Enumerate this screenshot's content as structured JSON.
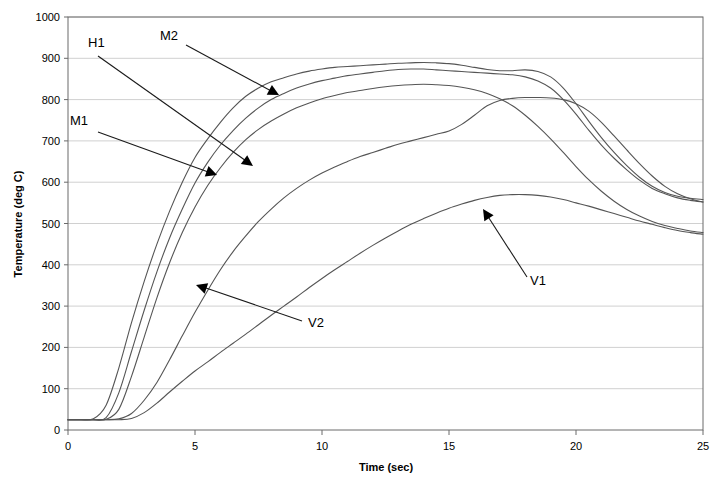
{
  "chart_data": {
    "type": "line",
    "title": "",
    "xlabel": "Time (sec)",
    "ylabel": "Temperature (deg C)",
    "xlim": [
      0,
      25
    ],
    "ylim": [
      0,
      1000
    ],
    "xticks": [
      0,
      5,
      10,
      15,
      20,
      25
    ],
    "yticks": [
      0,
      100,
      200,
      300,
      400,
      500,
      600,
      700,
      800,
      900,
      1000
    ],
    "grid": "horizontal",
    "legend": "inline-annotations",
    "x": [
      0,
      0.5,
      1,
      1.5,
      2,
      2.5,
      3,
      3.5,
      4,
      4.5,
      5,
      5.5,
      6,
      6.5,
      7,
      7.5,
      8,
      8.5,
      9,
      9.5,
      10,
      10.5,
      11,
      11.5,
      12,
      12.5,
      13,
      13.5,
      14,
      14.5,
      15,
      15.5,
      16,
      16.5,
      17,
      17.5,
      18,
      18.5,
      19,
      19.5,
      20,
      20.5,
      21,
      21.5,
      22,
      22.5,
      23,
      23.5,
      24,
      24.5,
      25
    ],
    "series": [
      {
        "name": "M2",
        "label": "M2",
        "color": "#555555",
        "values": [
          25,
          25,
          27,
          60,
          150,
          260,
          360,
          450,
          530,
          600,
          660,
          705,
          745,
          780,
          808,
          828,
          843,
          853,
          862,
          869,
          874,
          878,
          880,
          882,
          884,
          886,
          888,
          889,
          890,
          889,
          887,
          883,
          878,
          873,
          870,
          870,
          872,
          868,
          855,
          828,
          790,
          748,
          708,
          672,
          640,
          612,
          590,
          575,
          566,
          561,
          558
        ]
      },
      {
        "name": "H1",
        "label": "H1",
        "color": "#555555",
        "values": [
          25,
          25,
          25,
          30,
          90,
          190,
          290,
          383,
          465,
          535,
          598,
          648,
          690,
          725,
          755,
          780,
          800,
          815,
          828,
          838,
          846,
          852,
          858,
          862,
          866,
          870,
          873,
          874,
          874,
          872,
          870,
          868,
          866,
          864,
          862,
          860,
          855,
          845,
          828,
          800,
          765,
          726,
          690,
          658,
          630,
          605,
          585,
          572,
          562,
          556,
          552
        ]
      },
      {
        "name": "M1",
        "label": "M1",
        "color": "#555555",
        "values": [
          25,
          25,
          25,
          26,
          50,
          130,
          225,
          320,
          405,
          478,
          540,
          592,
          635,
          672,
          703,
          728,
          748,
          765,
          780,
          792,
          802,
          810,
          817,
          822,
          827,
          831,
          834,
          836,
          837,
          836,
          834,
          830,
          824,
          815,
          802,
          785,
          762,
          735,
          705,
          672,
          638,
          606,
          578,
          554,
          534,
          518,
          505,
          495,
          488,
          482,
          478
        ]
      },
      {
        "name": "V2",
        "label": "V2",
        "color": "#555555",
        "values": [
          25,
          25,
          25,
          25,
          27,
          40,
          72,
          115,
          170,
          228,
          285,
          338,
          388,
          432,
          470,
          505,
          535,
          562,
          585,
          605,
          622,
          637,
          650,
          662,
          672,
          682,
          692,
          700,
          708,
          716,
          724,
          740,
          762,
          785,
          798,
          803,
          805,
          805,
          804,
          800,
          790,
          772,
          745,
          712,
          678,
          645,
          615,
          590,
          572,
          560,
          552
        ]
      },
      {
        "name": "V1",
        "label": "V1",
        "color": "#555555",
        "values": [
          25,
          25,
          25,
          25,
          25,
          28,
          42,
          65,
          92,
          118,
          143,
          165,
          188,
          210,
          232,
          255,
          278,
          300,
          322,
          345,
          367,
          388,
          408,
          428,
          447,
          465,
          482,
          498,
          512,
          525,
          537,
          547,
          556,
          563,
          568,
          570,
          570,
          568,
          564,
          558,
          550,
          542,
          533,
          524,
          515,
          506,
          498,
          490,
          483,
          478,
          474
        ]
      }
    ],
    "annotations": [
      {
        "label": "H1",
        "text_x": 88,
        "text_y": 47,
        "line_x1": 98,
        "line_y1": 56,
        "line_x2": 249,
        "line_y2": 163,
        "head_x": 253,
        "head_y": 166
      },
      {
        "label": "M2",
        "text_x": 160,
        "text_y": 40,
        "line_x1": 186,
        "line_y1": 45,
        "line_x2": 273,
        "line_y2": 92,
        "head_x": 279,
        "head_y": 95
      },
      {
        "label": "M1",
        "text_x": 70,
        "text_y": 125,
        "line_x1": 98,
        "line_y1": 132,
        "line_x2": 211,
        "line_y2": 173,
        "head_x": 217,
        "head_y": 175
      },
      {
        "label": "V2",
        "text_x": 308,
        "text_y": 327,
        "line_x1": 302,
        "line_y1": 321,
        "line_x2": 203,
        "line_y2": 287,
        "head_x": 196,
        "head_y": 285
      },
      {
        "label": "V1",
        "text_x": 530,
        "text_y": 285,
        "line_x1": 527,
        "line_y1": 277,
        "line_x2": 487,
        "line_y2": 215,
        "head_x": 483,
        "head_y": 209
      }
    ]
  },
  "axes": {
    "y_title": "Temperature (deg C)",
    "x_title": "Time (sec)",
    "y_tick_labels": [
      "1000",
      "900",
      "800",
      "700",
      "600",
      "500",
      "400",
      "300",
      "200",
      "100",
      "0"
    ],
    "x_tick_labels": [
      "0",
      "5",
      "10",
      "15",
      "20",
      "25"
    ]
  }
}
